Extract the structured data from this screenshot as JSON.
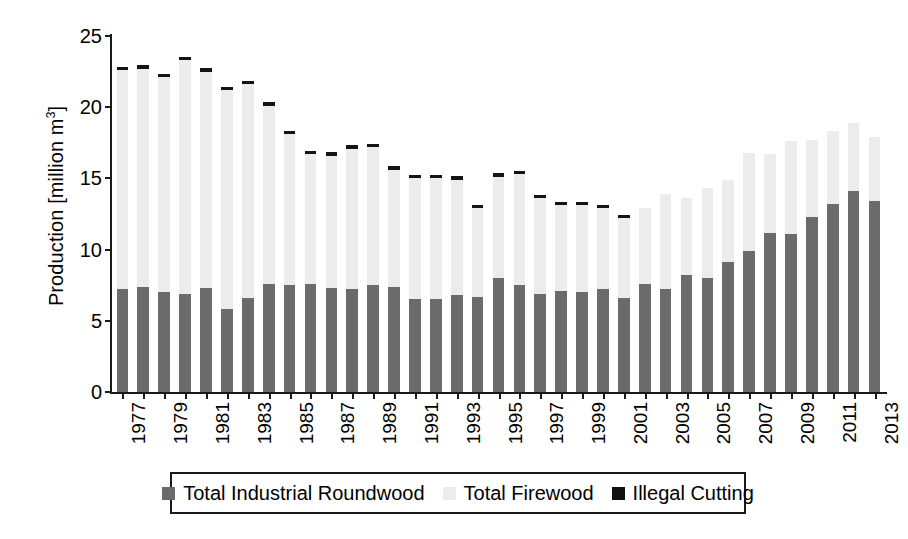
{
  "chart_data": {
    "type": "bar",
    "stacked": true,
    "title": "",
    "xlabel": "",
    "ylabel": "Production [million m3]",
    "ylabel_text": "Production [million m",
    "ylabel_sup": "3",
    "ylabel_tail": "]",
    "ylim": [
      0,
      25
    ],
    "yticks": [
      0,
      5,
      10,
      15,
      20,
      25
    ],
    "grid": false,
    "legend_position": "bottom",
    "categories": [
      1977,
      1978,
      1979,
      1980,
      1981,
      1982,
      1983,
      1984,
      1985,
      1986,
      1987,
      1988,
      1989,
      1990,
      1991,
      1992,
      1993,
      1994,
      1995,
      1996,
      1997,
      1998,
      1999,
      2000,
      2001,
      2002,
      2003,
      2004,
      2005,
      2006,
      2007,
      2008,
      2009,
      2010,
      2011,
      2012,
      2013
    ],
    "xtick_labels": [
      "1977",
      "1979",
      "1981",
      "1983",
      "1985",
      "1987",
      "1989",
      "1991",
      "1993",
      "1995",
      "1997",
      "1999",
      "2001",
      "2003",
      "2005",
      "2007",
      "2009",
      "2011",
      "2013"
    ],
    "series": [
      {
        "name": "Total Industrial Roundwood",
        "color": "#6b6b6b",
        "values": [
          7.2,
          7.4,
          7.0,
          6.9,
          7.3,
          5.8,
          6.6,
          7.6,
          7.5,
          7.6,
          7.3,
          7.2,
          7.5,
          7.4,
          6.5,
          6.5,
          6.8,
          6.7,
          8.0,
          7.5,
          6.9,
          7.1,
          7.0,
          7.2,
          6.6,
          7.6,
          7.2,
          8.2,
          8.0,
          9.1,
          9.9,
          11.2,
          11.1,
          12.3,
          13.2,
          14.1,
          13.4
        ]
      },
      {
        "name": "Total Firewood",
        "color": "#ececec",
        "values": [
          15.4,
          15.3,
          15.1,
          16.4,
          15.2,
          15.4,
          15.0,
          12.5,
          10.6,
          9.1,
          9.3,
          9.9,
          9.7,
          8.2,
          8.5,
          8.5,
          8.1,
          6.2,
          7.1,
          7.8,
          6.7,
          6.0,
          6.1,
          5.7,
          5.6,
          5.3,
          6.7,
          5.4,
          6.3,
          5.8,
          6.9,
          5.5,
          6.5,
          5.4,
          5.1,
          4.8,
          4.5
        ]
      },
      {
        "name": "Illegal Cutting",
        "color": "#141414",
        "values": [
          0.25,
          0.25,
          0.25,
          0.25,
          0.25,
          0.25,
          0.25,
          0.25,
          0.25,
          0.25,
          0.25,
          0.25,
          0.25,
          0.25,
          0.25,
          0.25,
          0.25,
          0.25,
          0.25,
          0.25,
          0.25,
          0.25,
          0.25,
          0.25,
          0.25,
          0.0,
          0.0,
          0.0,
          0.0,
          0.0,
          0.0,
          0.0,
          0.0,
          0.0,
          0.0,
          0.0,
          0.0
        ]
      }
    ],
    "totals": [
      22.6,
      22.75,
      22.1,
      23.35,
      22.5,
      21.2,
      21.6,
      20.1,
      18.05,
      16.75,
      16.6,
      17.1,
      17.2,
      15.65,
      15.0,
      15.0,
      14.9,
      12.9,
      15.1,
      15.25,
      13.6,
      13.1,
      13.1,
      12.9,
      12.2,
      12.9,
      13.9,
      13.6,
      14.3,
      14.9,
      16.8,
      16.7,
      17.6,
      17.7,
      18.3,
      18.9,
      17.9
    ]
  },
  "legend": {
    "items": [
      {
        "label": "Total Industrial Roundwood",
        "swatch": "dark-gray-swatch"
      },
      {
        "label": "Total Firewood",
        "swatch": "light-gray-swatch"
      },
      {
        "label": "Illegal Cutting",
        "swatch": "black-swatch"
      }
    ]
  }
}
